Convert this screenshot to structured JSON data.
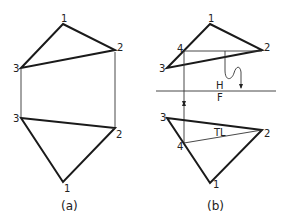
{
  "figure": {
    "a": {
      "caption": "(a)",
      "top_view": {
        "labels": {
          "p1": "1",
          "p2": "2",
          "p3": "3"
        }
      },
      "front_view": {
        "labels": {
          "p1": "1",
          "p2": "2",
          "p3": "3"
        }
      }
    },
    "b": {
      "caption": "(b)",
      "top_view": {
        "labels": {
          "p1": "1",
          "p2": "2",
          "p3": "3",
          "p4": "4"
        }
      },
      "fold_line": {
        "upper": "H",
        "lower": "F"
      },
      "front_view": {
        "labels": {
          "p1": "1",
          "p2": "2",
          "p3": "3",
          "p4": "4"
        },
        "true_length": "TL"
      }
    }
  },
  "colors": {
    "line": "#1a1a1a",
    "background": "#ffffff"
  }
}
